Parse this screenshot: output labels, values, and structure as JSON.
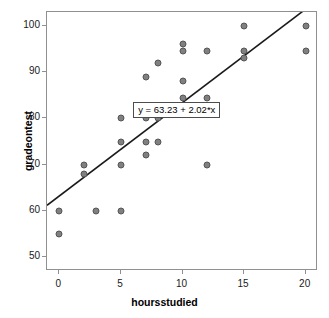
{
  "chart_data": {
    "type": "scatter",
    "title": "",
    "xlabel": "hoursstudied",
    "ylabel": "gradeontest",
    "xlim": [
      -1,
      21
    ],
    "ylim": [
      47,
      103
    ],
    "xticks": [
      0,
      5,
      10,
      15,
      20
    ],
    "yticks": [
      50,
      60,
      70,
      80,
      90,
      100
    ],
    "xtick_labels": [
      "0",
      "5",
      "10",
      "15",
      "20"
    ],
    "ytick_labels": [
      "50",
      "60",
      "70",
      "80",
      "90",
      "100"
    ],
    "grid": false,
    "legend": null,
    "marker_color": "#808080",
    "marker_edge_color": "#555555",
    "line_color": "#1a1a1a",
    "points": [
      {
        "x": 0,
        "y": 60
      },
      {
        "x": 0,
        "y": 55
      },
      {
        "x": 2,
        "y": 70
      },
      {
        "x": 2,
        "y": 68
      },
      {
        "x": 3,
        "y": 60
      },
      {
        "x": 5,
        "y": 80
      },
      {
        "x": 5,
        "y": 75
      },
      {
        "x": 5,
        "y": 70
      },
      {
        "x": 5,
        "y": 60
      },
      {
        "x": 7,
        "y": 89
      },
      {
        "x": 7,
        "y": 80
      },
      {
        "x": 7,
        "y": 75
      },
      {
        "x": 7,
        "y": 72
      },
      {
        "x": 8,
        "y": 92
      },
      {
        "x": 8,
        "y": 80
      },
      {
        "x": 8,
        "y": 75
      },
      {
        "x": 10,
        "y": 96
      },
      {
        "x": 10,
        "y": 94.5
      },
      {
        "x": 10,
        "y": 88
      },
      {
        "x": 10,
        "y": 84.5
      },
      {
        "x": 12,
        "y": 94.5
      },
      {
        "x": 12,
        "y": 84.5
      },
      {
        "x": 12,
        "y": 70
      },
      {
        "x": 15,
        "y": 100
      },
      {
        "x": 15,
        "y": 94.5
      },
      {
        "x": 15,
        "y": 93
      },
      {
        "x": 20,
        "y": 100
      },
      {
        "x": 20,
        "y": 94.5
      }
    ],
    "fit_line": {
      "intercept": 63.23,
      "slope": 2.02,
      "label": "y = 63.23 + 2.02*x",
      "x_start": -1,
      "x_end": 20.5
    }
  }
}
